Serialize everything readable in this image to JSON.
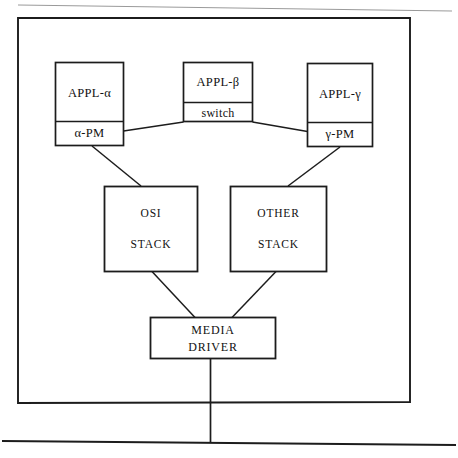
{
  "diagram": {
    "frame": {
      "name": "system-boundary"
    },
    "colors": {
      "stroke": "#1c1c1c",
      "background": "#ffffff",
      "faint_scan_line": "#8c8c8c"
    },
    "nodes": {
      "appl_alpha": {
        "top_label": "APPL-α",
        "bottom_label": "α-PM"
      },
      "appl_beta": {
        "top_label": "APPL-β",
        "bottom_label": "switch"
      },
      "appl_gamma": {
        "top_label": "APPL-γ",
        "bottom_label": "γ-PM"
      },
      "osi_stack": {
        "line1": "OSI",
        "line2": "STACK"
      },
      "other_stack": {
        "line1": "OTHER",
        "line2": "STACK"
      },
      "media_driver": {
        "line1": "MEDIA",
        "line2": "DRIVER"
      }
    },
    "connections": [
      {
        "name": "alpha-pm-to-switch",
        "from": "α-PM",
        "to": "switch"
      },
      {
        "name": "switch-to-gamma-pm",
        "from": "switch",
        "to": "γ-PM"
      },
      {
        "name": "alpha-pm-to-osi-stack",
        "from": "α-PM",
        "to": "OSI STACK"
      },
      {
        "name": "gamma-pm-to-other-stack",
        "from": "γ-PM",
        "to": "OTHER STACK"
      },
      {
        "name": "osi-stack-to-media-driver",
        "from": "OSI STACK",
        "to": "MEDIA DRIVER"
      },
      {
        "name": "other-stack-to-media-driver",
        "from": "OTHER STACK",
        "to": "MEDIA DRIVER"
      },
      {
        "name": "media-driver-to-bus",
        "from": "MEDIA DRIVER",
        "to": "network bus"
      }
    ],
    "bus": {
      "name": "network-bus-line"
    }
  }
}
